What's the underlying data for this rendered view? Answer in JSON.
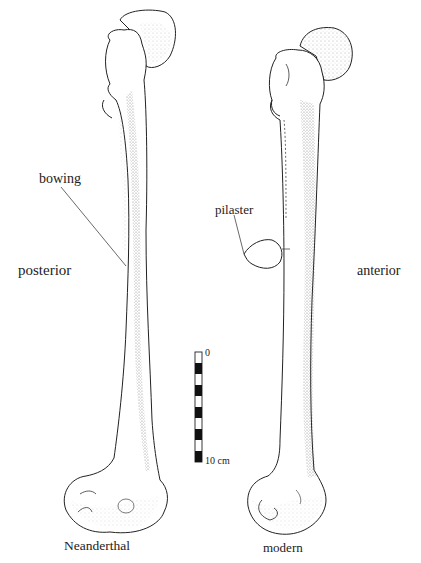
{
  "figure": {
    "specimens": [
      {
        "id": "left",
        "caption": "Neanderthal"
      },
      {
        "id": "right",
        "caption": "modern"
      }
    ],
    "annotations": {
      "bowing": "bowing",
      "posterior": "posterior",
      "pilaster": "pilaster",
      "anterior": "anterior"
    },
    "scale_bar": {
      "start_label": "0",
      "end_label": "10 cm",
      "segments": 10
    }
  },
  "colors": {
    "ink": "#222222",
    "background": "#ffffff",
    "stipple": "#555555"
  }
}
